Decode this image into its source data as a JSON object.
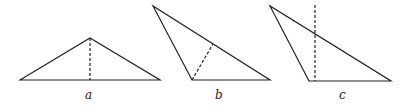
{
  "diagram": {
    "title": "",
    "stroke_color": "#222222",
    "triangles": [
      {
        "label": "a",
        "vertices": [
          [
            20,
            80
          ],
          [
            90,
            38
          ],
          [
            160,
            80
          ]
        ],
        "dashed": [
          [
            90,
            38
          ],
          [
            90,
            80
          ]
        ]
      },
      {
        "label": "b",
        "vertices": [
          [
            153,
            6
          ],
          [
            192,
            80
          ],
          [
            270,
            80
          ]
        ],
        "dashed": [
          [
            192,
            80
          ],
          [
            213,
            44
          ]
        ]
      },
      {
        "label": "c",
        "vertices": [
          [
            270,
            6
          ],
          [
            309,
            81
          ],
          [
            391,
            81
          ]
        ],
        "dashed": [
          [
            315,
            5
          ],
          [
            315,
            81
          ]
        ]
      }
    ]
  }
}
